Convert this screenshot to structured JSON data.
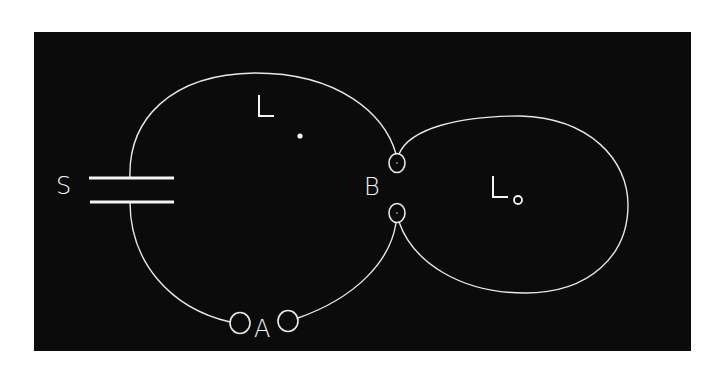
{
  "figure": {
    "background_color": "#ffffff",
    "panel_color": "#0b0b0b",
    "line_color": "#e8e8e8",
    "text_color": "#f4f4f4"
  },
  "labels": {
    "source": "S",
    "junction_a": "A",
    "junction_b": "B",
    "left_loop": "L",
    "right_loop": "L",
    "right_loop_subscript": "o"
  },
  "elements": {
    "source_plates": {
      "count": 2,
      "description": "two parallel horizontal bars"
    },
    "left_loop_point": {
      "description": "small filled dot inside loop L"
    },
    "junction_a_circles": 2,
    "junction_b_circles": 2
  }
}
